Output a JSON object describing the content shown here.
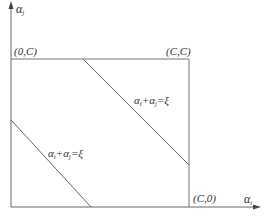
{
  "diagram": {
    "axes": {
      "x_label": {
        "symbol": "α",
        "sub": "i"
      },
      "y_label": {
        "symbol": "α",
        "sub": "j"
      }
    },
    "corners": {
      "top_left": "(0,C)",
      "top_right": "(C,C)",
      "bottom_right": "(C,0)"
    },
    "lines": [
      {
        "id": "upper",
        "eq_a": "α",
        "eq_a_sub": "i",
        "plus": "+",
        "eq_b": "α",
        "eq_b_sub": "j",
        "rhs": "=ξ"
      },
      {
        "id": "lower",
        "eq_a": "α",
        "eq_a_sub": "i",
        "plus": "+",
        "eq_b": "α",
        "eq_b_sub": "j",
        "rhs": "=ξ"
      }
    ],
    "colors": {
      "line": "#555555",
      "text": "#333333",
      "background": "#ffffff"
    }
  }
}
